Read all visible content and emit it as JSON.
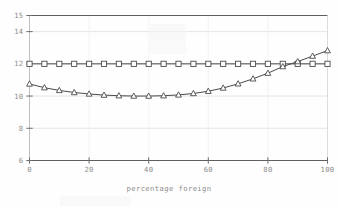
{
  "chart_data": {
    "type": "line",
    "title": "",
    "subtitle": "",
    "xlabel": "percentage foreign",
    "ylabel": "",
    "xlim": [
      0,
      100
    ],
    "ylim": [
      6,
      15
    ],
    "grid": true,
    "grid_axis": "y",
    "legend": "none",
    "x_ticks": [
      0,
      20,
      40,
      60,
      80,
      100
    ],
    "x_tick_labels": [
      "0",
      "20",
      "40",
      "60",
      "80",
      "100"
    ],
    "y_ticks": [
      6,
      8,
      10,
      12,
      14,
      15
    ],
    "y_tick_labels": [
      "6",
      "8",
      "10",
      "12",
      "14",
      "15"
    ],
    "x": [
      0,
      5,
      10,
      15,
      20,
      25,
      30,
      35,
      40,
      45,
      50,
      55,
      60,
      65,
      70,
      75,
      80,
      85,
      90,
      95,
      100
    ],
    "series": [
      {
        "name": "flat-reference",
        "marker": "square",
        "color": "#4b4b4b",
        "values": [
          12.0,
          12.0,
          12.0,
          12.0,
          12.0,
          12.0,
          12.0,
          12.0,
          12.0,
          12.0,
          12.0,
          12.0,
          12.0,
          12.0,
          12.0,
          12.0,
          12.0,
          12.0,
          12.0,
          12.0,
          12.0
        ]
      },
      {
        "name": "curved-response",
        "marker": "triangle",
        "color": "#4b4b4b",
        "values": [
          10.75,
          10.52,
          10.35,
          10.22,
          10.13,
          10.06,
          10.02,
          10.0,
          10.0,
          10.02,
          10.07,
          10.16,
          10.3,
          10.5,
          10.76,
          11.07,
          11.42,
          11.83,
          12.14,
          12.48,
          12.82
        ]
      }
    ]
  },
  "axes": {
    "x_axis_name": "percentage foreign",
    "y_axis_name": ""
  }
}
